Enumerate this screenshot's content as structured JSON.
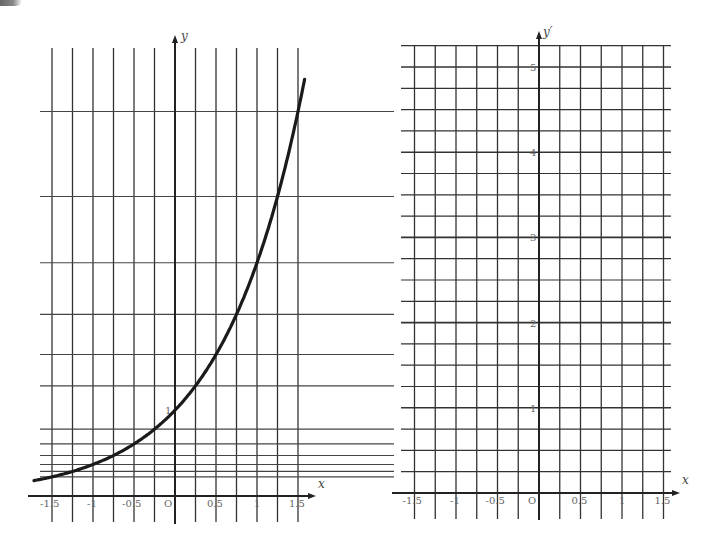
{
  "left_graph": {
    "title": "graph of y = e^x",
    "x_axis_label": "x",
    "y_axis_label": "y",
    "origin_label": "O",
    "x_tick_labels": [
      "-1.5",
      "-1",
      "-0.5",
      "O",
      "0.5",
      "1",
      "1.5"
    ],
    "y_tick_labels": [
      "1"
    ],
    "curve": "y = e^x",
    "grid_x_values": [
      -1.5,
      -1.25,
      -1,
      -0.75,
      -0.5,
      -0.25,
      0,
      0.25,
      0.5,
      0.75,
      1,
      1.25,
      1.5
    ],
    "grid_y_values": [
      0.223,
      0.287,
      0.368,
      0.472,
      0.607,
      0.779,
      1.284,
      1.649,
      2.117,
      2.718,
      3.49,
      4.482
    ]
  },
  "right_graph": {
    "title": "blank grid for y'",
    "x_axis_label": "x",
    "y_axis_label": "y′",
    "origin_label": "O",
    "x_tick_labels": [
      "-1.5",
      "-1",
      "-0.5",
      "O",
      "0.5",
      "1",
      "1.5"
    ],
    "y_tick_labels": [
      "1",
      "2",
      "3",
      "4",
      "5"
    ],
    "grid_x_step": 0.25,
    "grid_y_step": 0.25
  },
  "chart_data": [
    {
      "type": "line",
      "title": "y = e^x",
      "xlabel": "x",
      "ylabel": "y",
      "x": [
        -1.5,
        -1.25,
        -1,
        -0.75,
        -0.5,
        -0.25,
        0,
        0.25,
        0.5,
        0.75,
        1,
        1.25,
        1.5,
        1.6
      ],
      "series": [
        {
          "name": "y = e^x",
          "values": [
            0.223,
            0.287,
            0.368,
            0.472,
            0.607,
            0.779,
            1.0,
            1.284,
            1.649,
            2.117,
            2.718,
            3.49,
            4.482,
            4.953
          ]
        }
      ],
      "xlim": [
        -1.6,
        1.6
      ],
      "ylim": [
        0,
        5
      ],
      "x_ticks": [
        -1.5,
        -1,
        -0.5,
        0,
        0.5,
        1,
        1.5
      ],
      "y_ticks": [
        1
      ],
      "grid": true
    },
    {
      "type": "line",
      "title": "blank derivative grid",
      "xlabel": "x",
      "ylabel": "y′",
      "x": [],
      "series": [],
      "xlim": [
        -1.6,
        1.6
      ],
      "ylim": [
        0,
        5.25
      ],
      "x_ticks": [
        -1.5,
        -1,
        -0.5,
        0,
        0.5,
        1,
        1.5
      ],
      "y_ticks": [
        1,
        2,
        3,
        4,
        5
      ],
      "grid": true
    }
  ]
}
